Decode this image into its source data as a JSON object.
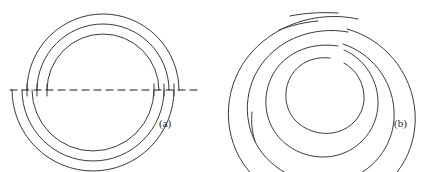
{
  "page": {
    "width": 434,
    "height": 172,
    "background_color": "#ffffff"
  },
  "style": {
    "stroke_color": "#3a3a3a",
    "stroke_width": 1.0,
    "axis_stroke_color": "#1d1d1d",
    "axis_dash_pattern": "7,5",
    "label_color": "#2b2b2b"
  },
  "figures": [
    {
      "id": "figure-a",
      "label": "(a)",
      "label_position": {
        "x": 159,
        "y": 117
      },
      "description": "Approximate spiral built from joined semicircular arcs about two alternating centers, with a dashed horizontal construction axis.",
      "center_upper": {
        "x": 103,
        "y": 90
      },
      "center_lower": {
        "x": 93,
        "y": 90
      },
      "axis": {
        "name": "construction-axis",
        "y": 90,
        "x_start": 10,
        "x_end": 201,
        "dashed": true
      },
      "upper_arcs_radii": [
        76,
        66,
        56
      ],
      "lower_arcs_radii": [
        81,
        71,
        61
      ],
      "tick_marks_x": [
        22,
        32,
        42,
        169,
        179,
        189
      ]
    },
    {
      "id": "figure-b",
      "label": "(b)",
      "label_position": {
        "x": 394,
        "y": 117
      },
      "description": "Archimedean spiral of about four turns drawn as a continuous curve with small breaks between successive turns.",
      "center": {
        "x": 324,
        "y": 88
      },
      "inner_radius": 30,
      "outer_radius": 79,
      "turns": 4,
      "start_angle_deg": -80,
      "end_angle_deg": 1360,
      "break_angles_deg": [
        -70,
        260,
        640,
        1010
      ]
    }
  ]
}
